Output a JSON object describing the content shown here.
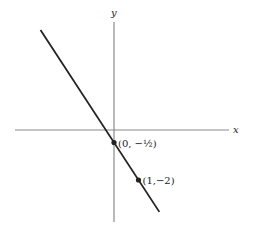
{
  "chart_data": {
    "type": "line",
    "title": "",
    "xlabel": "x",
    "ylabel": "y",
    "grid": false,
    "xlim": [
      -2.8,
      4.5
    ],
    "ylim": [
      -3.5,
      3.8
    ],
    "series": [
      {
        "name": "y = -3/2 x - 1/2",
        "slope": -1.5,
        "intercept": -0.5,
        "x": [
          -2.8,
          1.75
        ],
        "y": [
          3.7,
          -3.125
        ]
      }
    ],
    "points": [
      {
        "x": 0,
        "y": -0.5,
        "label": "(0, −½)"
      },
      {
        "x": 1,
        "y": -2,
        "label": "(1,−2)"
      }
    ],
    "colors": {
      "line": "#222222",
      "axis": "#888888"
    }
  }
}
